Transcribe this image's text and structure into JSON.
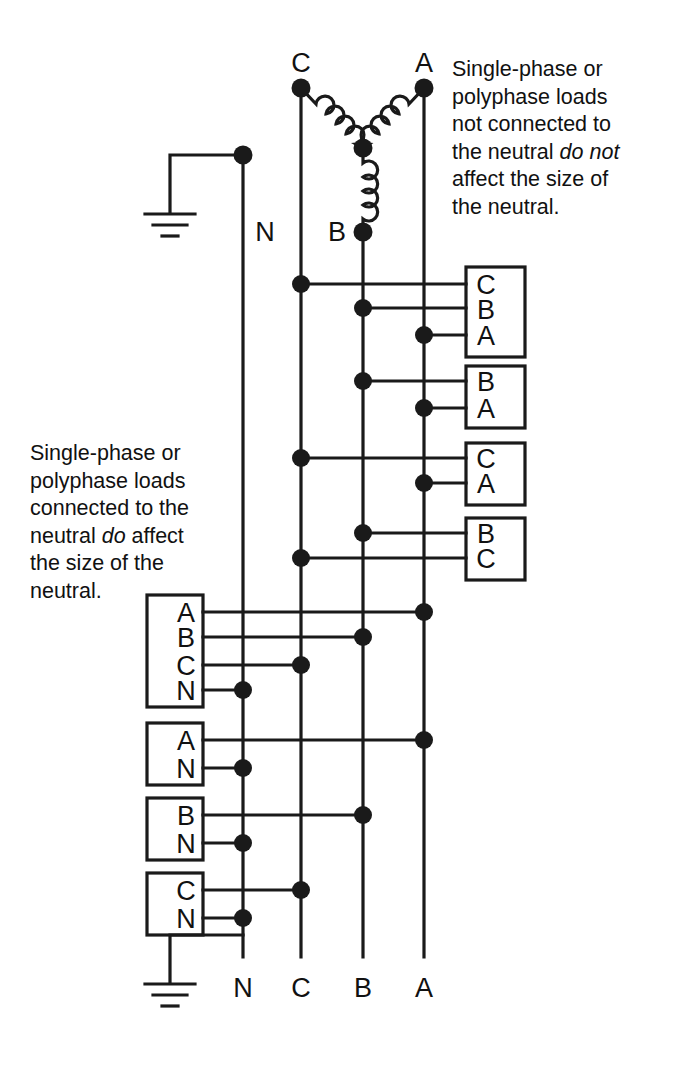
{
  "diagram": {
    "notes": {
      "top_right": {
        "line1": "Single-phase or",
        "line2": "polyphase loads",
        "line3": "not connected to",
        "line4_pre": "the neutral ",
        "line4_em": "do not",
        "line5": "affect the size of",
        "line6": "the neutral."
      },
      "bottom_left": {
        "line1": "Single-phase or",
        "line2": "polyphase loads",
        "line3": "connected to the",
        "line4_pre": "neutral ",
        "line4_em": "do",
        "line4_post": " affect",
        "line5": "the size of the",
        "line6": "neutral."
      }
    },
    "source": {
      "type": "wye",
      "terminal_labels": {
        "c": "C",
        "a": "A",
        "b": "B"
      }
    },
    "bus_labels_top": {
      "neutral": "N",
      "phase_b": "B"
    },
    "bus_labels_bottom": [
      "N",
      "C",
      "B",
      "A"
    ],
    "ground_symbols": [
      "top-ground",
      "bottom-ground"
    ],
    "loads_right": [
      {
        "name": "load-cba",
        "terminals": [
          "C",
          "B",
          "A"
        ]
      },
      {
        "name": "load-ba",
        "terminals": [
          "B",
          "A"
        ]
      },
      {
        "name": "load-ca",
        "terminals": [
          "C",
          "A"
        ]
      },
      {
        "name": "load-bc",
        "terminals": [
          "B",
          "C"
        ]
      }
    ],
    "loads_left": [
      {
        "name": "load-abcn",
        "terminals": [
          "A",
          "B",
          "C",
          "N"
        ]
      },
      {
        "name": "load-an",
        "terminals": [
          "A",
          "N"
        ]
      },
      {
        "name": "load-bn",
        "terminals": [
          "B",
          "N"
        ]
      },
      {
        "name": "load-cn",
        "terminals": [
          "C",
          "N"
        ]
      }
    ],
    "colors": {
      "line": "#1a1a1a",
      "text": "#111111",
      "background": "#ffffff"
    }
  }
}
